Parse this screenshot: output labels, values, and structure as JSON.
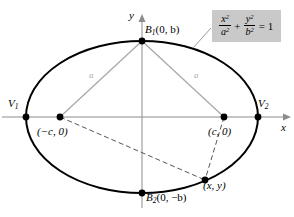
{
  "figure": {
    "type": "ellipse-geometry-diagram",
    "axes": {
      "x_label": "x",
      "y_label": "y"
    },
    "equation_box": {
      "numerator_1": "x",
      "numerator_1_exp": "2",
      "denominator_1": "a",
      "denominator_1_exp": "2",
      "plus": "+",
      "numerator_2": "y",
      "numerator_2_exp": "2",
      "denominator_2": "b",
      "denominator_2_exp": "2",
      "equals": "= 1",
      "background": "#c9c9c9"
    },
    "points": [
      {
        "name": "top-co-vertex",
        "symbol": "B",
        "subscript": "1",
        "coords": "(0, b)"
      },
      {
        "name": "bottom-co-vertex",
        "symbol": "B",
        "subscript": "2",
        "coords": "(0, −b)"
      },
      {
        "name": "left-vertex",
        "symbol": "V",
        "subscript": "1",
        "coords": ""
      },
      {
        "name": "right-vertex",
        "symbol": "V",
        "subscript": "2",
        "coords": ""
      },
      {
        "name": "left-focus",
        "symbol": "",
        "subscript": "",
        "coords": "(−c, 0)"
      },
      {
        "name": "right-focus",
        "symbol": "",
        "subscript": "",
        "coords": "(c, 0)"
      },
      {
        "name": "ellipse-point",
        "symbol": "",
        "subscript": "",
        "coords": "(x, y)"
      }
    ],
    "segment_labels": {
      "left_a": "a",
      "right_a": "a"
    },
    "colors": {
      "curve": "#000000",
      "axis": "#8c8c8c",
      "segment": "#a9a9a9",
      "dashed": "#555555",
      "box_fill": "#c9c9c9",
      "background": "#ffffff"
    }
  }
}
